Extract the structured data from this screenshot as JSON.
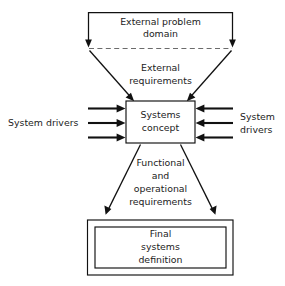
{
  "diagram": {
    "background_color": "#ffffff",
    "line_color": "#111111",
    "dashed_line_color": "#6b6b6b",
    "text_color": "#1c1c1c",
    "nodes": {
      "external_problem_domain": {
        "label_line_1": "External problem",
        "label_line_2": "domain",
        "shape": "open-bracket-funnel-top"
      },
      "external_requirements": {
        "label_line_1": "External",
        "label_line_2": "requirements",
        "shape": "funnel-label"
      },
      "systems_concept": {
        "label_line_1": "Systems",
        "label_line_2": "concept",
        "shape": "rectangle"
      },
      "system_drivers_left": {
        "label_line_1": "System drivers",
        "arrow_count": 3,
        "direction": "right"
      },
      "system_drivers_right": {
        "label_line_1": "System",
        "label_line_2": "drivers",
        "arrow_count": 3,
        "direction": "left"
      },
      "functional_operational_requirements": {
        "label_line_1": "Functional",
        "label_line_2": "and",
        "label_line_3": "operational",
        "label_line_4": "requirements",
        "shape": "fan-out-label"
      },
      "final_systems_definition": {
        "label_line_1": "Final",
        "label_line_2": "systems",
        "label_line_3": "definition",
        "shape": "double-rectangle"
      }
    }
  }
}
